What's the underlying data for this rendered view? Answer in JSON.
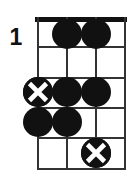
{
  "diagram": {
    "kind": "guitar-chord-diagram",
    "fret_label": "1",
    "nut_shown": true,
    "string_count": 4,
    "fret_count": 5,
    "colors": {
      "ink": "#111111",
      "grid": "#333333",
      "background": "#ffffff"
    },
    "markers": [
      {
        "string": 2,
        "fret": 1,
        "type": "filled",
        "label": ""
      },
      {
        "string": 3,
        "fret": 1,
        "type": "filled",
        "label": ""
      },
      {
        "string": 1,
        "fret": 3,
        "type": "root",
        "label": ""
      },
      {
        "string": 2,
        "fret": 3,
        "type": "filled",
        "label": ""
      },
      {
        "string": 3,
        "fret": 3,
        "type": "filled",
        "label": ""
      },
      {
        "string": 1,
        "fret": 4,
        "type": "filled",
        "label": ""
      },
      {
        "string": 2,
        "fret": 4,
        "type": "filled",
        "label": ""
      },
      {
        "string": 3,
        "fret": 5,
        "type": "root",
        "label": ""
      }
    ],
    "geometry": {
      "string_x": [
        0,
        29,
        58,
        87
      ],
      "fret_y": [
        0,
        29,
        60,
        90,
        120,
        151
      ],
      "marker_y": [
        17,
        46,
        75,
        105,
        136
      ]
    }
  }
}
